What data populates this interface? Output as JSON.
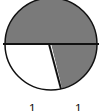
{
  "diagram": {
    "type": "circle-fraction",
    "center": [
      51,
      44
    ],
    "radius": 46,
    "colors": {
      "shaded": "#7a7a7a",
      "unshaded": "#ffffff",
      "stroke": "#111111"
    },
    "sectors": [
      {
        "name": "top-half",
        "shaded": true,
        "start_deg": 180,
        "end_deg": 360
      },
      {
        "name": "bottom-right",
        "shaded": true,
        "start_deg": 0,
        "end_deg": 76
      },
      {
        "name": "bottom-left",
        "shaded": false,
        "start_deg": 76,
        "end_deg": 180
      }
    ]
  },
  "labels": [
    "1",
    "1"
  ]
}
